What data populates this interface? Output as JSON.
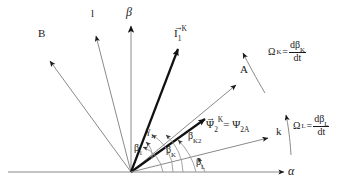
{
  "figure": {
    "type": "vector-angle-diagram",
    "background_color": "#ffffff",
    "line_color_thin": "#8a8a8a",
    "line_color_bold": "#111111",
    "text_color": "#1a1a1a"
  },
  "axes": {
    "horizontal": {
      "name": "alpha-axis",
      "label": "α"
    },
    "vertical": {
      "name": "beta-axis",
      "label": "β"
    },
    "origin_px": [
      131,
      172
    ]
  },
  "vectors": [
    {
      "id": "B",
      "label": "B",
      "style": "thin",
      "arrow_at": "tip",
      "tip_px": [
        48,
        59
      ],
      "label_px": [
        41,
        33
      ]
    },
    {
      "id": "l",
      "label": "l",
      "style": "thin",
      "arrow_at": "tip",
      "tip_px": [
        95,
        33
      ],
      "label_px": [
        92,
        12
      ]
    },
    {
      "id": "I1K",
      "label": "I",
      "sub": "1",
      "sup": "K",
      "vector_arrow": true,
      "style": "bold",
      "arrow_at": "tip",
      "tip_px": [
        179,
        46
      ],
      "label_px": [
        178,
        29
      ]
    },
    {
      "id": "A",
      "label": "A",
      "style": "thin",
      "arrow_at": "tip",
      "tip_px": [
        238,
        83
      ],
      "label_px": [
        240,
        70
      ]
    },
    {
      "id": "Psi2K",
      "label": "Ψ",
      "sub": "2",
      "sup": "K",
      "vector_arrow": true,
      "style": "bold",
      "arrow_at": "tip",
      "tip_px": [
        207,
        117
      ],
      "equals_text": "= Ψ",
      "equals_sub": "2A",
      "label_px": [
        209,
        120
      ]
    },
    {
      "id": "k",
      "label": "k",
      "style": "thin",
      "arrow_at": "tip",
      "tip_px": [
        271,
        137
      ],
      "label_px": [
        276,
        130
      ]
    }
  ],
  "angles": [
    {
      "id": "gamma1",
      "label": "γ",
      "sub": "1",
      "label_px": [
        148,
        130
      ]
    },
    {
      "id": "beta1",
      "label": "β",
      "sub": "1",
      "label_px": [
        136,
        146
      ]
    },
    {
      "id": "betaK",
      "label": "β",
      "sub": "K",
      "label_px": [
        168,
        148
      ]
    },
    {
      "id": "betaK2",
      "label": "β",
      "sub": "K2",
      "label_px": [
        190,
        134
      ]
    },
    {
      "id": "betaL",
      "label": "β",
      "sub": "L",
      "label_px": [
        198,
        160
      ]
    }
  ],
  "rotations": [
    {
      "id": "omega-K",
      "symbol": "Ω",
      "sub": "K",
      "equals": "=",
      "numerator": "dβ",
      "numerator_sub": "K",
      "denominator": "dt",
      "label_px": [
        272,
        46
      ],
      "arc_arrow_tip_px": [
        241,
        51
      ]
    },
    {
      "id": "omega-L",
      "symbol": "Ω",
      "sub": "L",
      "equals": "=",
      "numerator": "dβ",
      "numerator_sub": "L",
      "denominator": "dt",
      "label_px": [
        297,
        120
      ],
      "arc_arrow_tip_px": [
        285,
        113
      ]
    }
  ]
}
